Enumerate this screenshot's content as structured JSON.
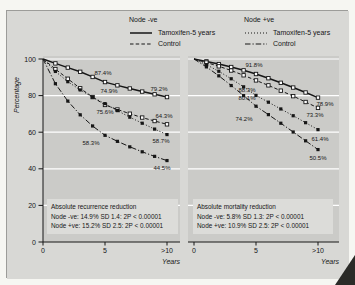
{
  "colors": {
    "page_bg": "#f6f6f2",
    "panel_bg": "#d8d8d5",
    "plot_bg": "#cbcbc8",
    "grid": "#ffffff",
    "line": "#161616",
    "note_bg": "#dcdcd9"
  },
  "figure": {
    "ylabel": "Percentage",
    "xlabel": "Years",
    "y_ticks": [
      "100",
      "80",
      "60",
      "40",
      "20",
      "0"
    ],
    "y_tick_values": [
      100,
      80,
      60,
      40,
      20,
      0
    ]
  },
  "legend": {
    "groups": [
      {
        "title": "Node -ve",
        "items": [
          {
            "style": "solid",
            "label": "Tamoxifen-5 years"
          },
          {
            "style": "dashed",
            "label": "Control"
          }
        ]
      },
      {
        "title": "Node +ve",
        "items": [
          {
            "style": "dotted",
            "label": "Tamoxifen-5 years"
          },
          {
            "style": "dashdot",
            "label": "Control"
          }
        ]
      }
    ]
  },
  "chart_data": [
    {
      "type": "line",
      "panel": "left",
      "title": "Absolute recurrence reduction",
      "xlabel": "Years",
      "ylabel": "Percentage",
      "ylim": [
        0,
        100
      ],
      "grid": "horizontal white lines every 20",
      "x": [
        0,
        1,
        2,
        3,
        4,
        5,
        6,
        7,
        8,
        9,
        10
      ],
      "x_tick_labels": [
        "0",
        "5",
        ">10"
      ],
      "series": [
        {
          "name": "Node -ve Tamoxifen-5 years",
          "line": "solid",
          "marker": "open-square",
          "values": [
            100,
            97.6,
            95.3,
            93.0,
            90.2,
            87.4,
            85.6,
            83.9,
            82.2,
            80.7,
            79.2
          ],
          "point_labels": [
            {
              "x": 5,
              "text": "87.4%"
            },
            {
              "x": 10,
              "text": "79.2%"
            }
          ]
        },
        {
          "name": "Node -ve Control",
          "line": "dashed",
          "marker": "open-square",
          "values": [
            100,
            94.5,
            89.2,
            84.0,
            79.2,
            74.9,
            72.4,
            70.1,
            68.0,
            66.1,
            64.3
          ],
          "point_labels": [
            {
              "x": 5,
              "text": "74.9%"
            },
            {
              "x": 10,
              "text": "64.3%"
            }
          ]
        },
        {
          "name": "Node +ve Tamoxifen-5 years",
          "line": "dotted",
          "marker": "filled-square",
          "values": [
            100,
            93.2,
            87.6,
            83.1,
            79.1,
            75.6,
            71.8,
            68.2,
            64.9,
            61.7,
            58.7
          ],
          "point_labels": [
            {
              "x": 5,
              "text": "75.6%"
            },
            {
              "x": 10,
              "text": "58.7%"
            }
          ]
        },
        {
          "name": "Node +ve Control",
          "line": "dashdot",
          "marker": "filled-square",
          "values": [
            100,
            86.5,
            77.0,
            69.5,
            63.4,
            58.3,
            55.0,
            52.0,
            49.3,
            46.8,
            44.5
          ],
          "point_labels": [
            {
              "x": 5,
              "text": "58.3%"
            },
            {
              "x": 10,
              "text": "44.5%"
            }
          ]
        }
      ],
      "note": {
        "title": "Absolute recurrence reduction",
        "line1": "Node -ve: 14.9%  SD 1.4: 2P < 0.00001",
        "line2": "Node +ve: 15.2%  SD 2.5: 2P < 0.00001"
      }
    },
    {
      "type": "line",
      "panel": "right",
      "title": "Absolute mortality reduction",
      "xlabel": "Years",
      "ylabel": "Percentage",
      "ylim": [
        0,
        100
      ],
      "grid": "horizontal white lines every 20",
      "x": [
        0,
        1,
        2,
        3,
        4,
        5,
        6,
        7,
        8,
        9,
        10
      ],
      "x_tick_labels": [
        "0",
        "5",
        ">10"
      ],
      "series": [
        {
          "name": "Node -ve Tamoxifen-5 years",
          "line": "solid",
          "marker": "open-square",
          "values": [
            100,
            98.7,
            97.2,
            95.6,
            93.8,
            91.8,
            89.5,
            87.0,
            84.4,
            81.7,
            78.9
          ],
          "point_labels": [
            {
              "x": 5,
              "text": "91.8%"
            },
            {
              "x": 10,
              "text": "78.9%"
            }
          ]
        },
        {
          "name": "Node -ve Control",
          "line": "dashed",
          "marker": "open-square",
          "values": [
            100,
            98.1,
            96.0,
            93.7,
            91.1,
            88.3,
            85.6,
            82.7,
            79.7,
            76.5,
            73.3
          ],
          "point_labels": [
            {
              "x": 5,
              "text": "88.3%"
            },
            {
              "x": 10,
              "text": "73.3%"
            }
          ]
        },
        {
          "name": "Node +ve Tamoxifen-5 years",
          "line": "dotted",
          "marker": "filled-square",
          "values": [
            100,
            96.9,
            93.3,
            89.2,
            84.8,
            80.1,
            76.4,
            72.7,
            69.0,
            65.2,
            61.4
          ],
          "point_labels": [
            {
              "x": 5,
              "text": "80.1%"
            },
            {
              "x": 10,
              "text": "61.4%"
            }
          ]
        },
        {
          "name": "Node +ve Control",
          "line": "dashdot",
          "marker": "filled-square",
          "values": [
            100,
            95.7,
            90.8,
            85.5,
            80.0,
            74.2,
            69.6,
            64.9,
            60.1,
            55.3,
            50.5
          ],
          "point_labels": [
            {
              "x": 5,
              "text": "74.2%"
            },
            {
              "x": 10,
              "text": "50.5%"
            }
          ]
        }
      ],
      "note": {
        "title": "Absolute mortality reduction",
        "line1": "Node -ve: 5.8%  SD 1.3: 2P < 0.00001",
        "line2": "Node +ve: 10.9%  SD 2.5: 2P < 0.00001"
      }
    }
  ]
}
